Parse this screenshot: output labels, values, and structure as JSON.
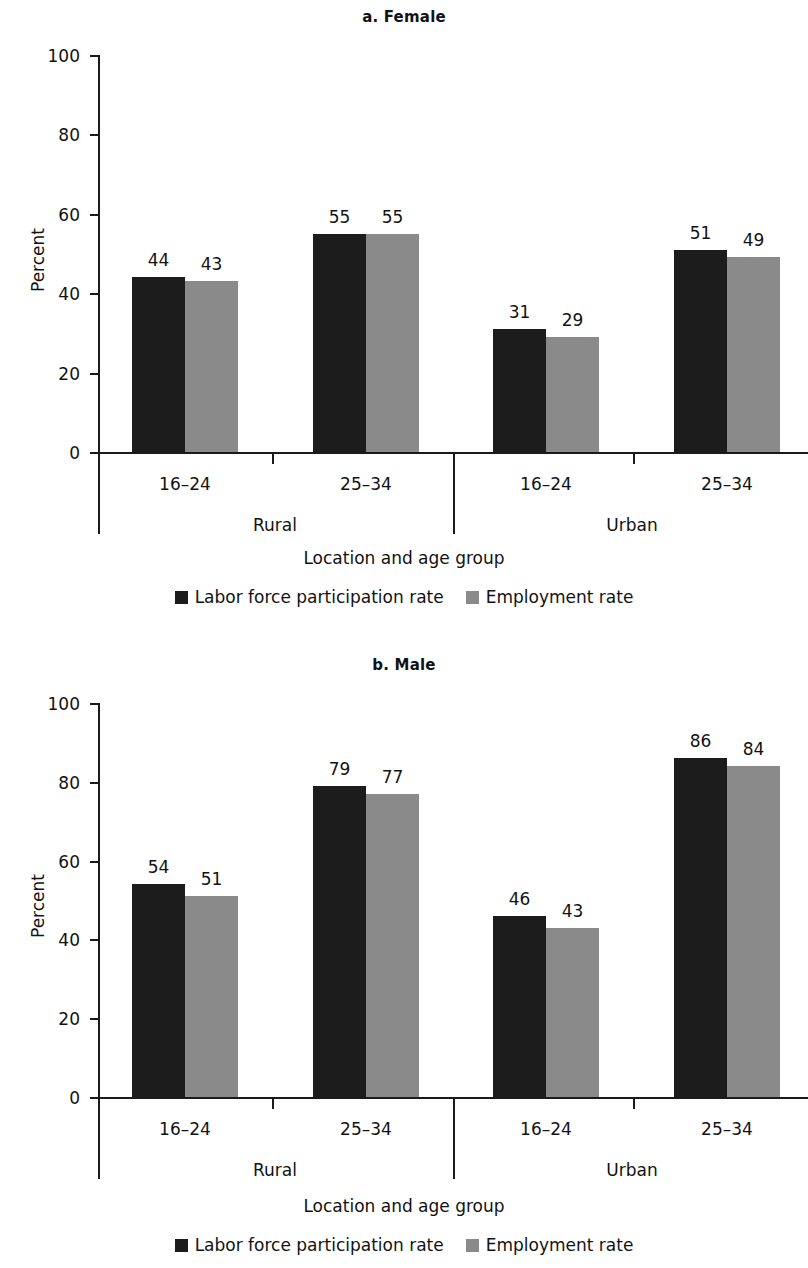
{
  "figure": {
    "panels": [
      {
        "title": "a. Female",
        "ylabel": "Percent",
        "xlabel": "Location and age group",
        "ytick_labels": [
          "100",
          "80",
          "60",
          "40",
          "20",
          "0"
        ],
        "age_labels": [
          "16–24",
          "25–34",
          "16–24",
          "25–34"
        ],
        "location_labels": [
          "Rural",
          "Urban"
        ],
        "values": [
          "44",
          "43",
          "55",
          "55",
          "31",
          "29",
          "51",
          "49"
        ],
        "legend": [
          "Labor force participation rate",
          "Employment rate"
        ]
      },
      {
        "title": "b. Male",
        "ylabel": "Percent",
        "xlabel": "Location and age group",
        "ytick_labels": [
          "100",
          "80",
          "60",
          "40",
          "20",
          "0"
        ],
        "age_labels": [
          "16–24",
          "25–34",
          "16–24",
          "25–34"
        ],
        "location_labels": [
          "Rural",
          "Urban"
        ],
        "values": [
          "54",
          "51",
          "79",
          "77",
          "46",
          "43",
          "86",
          "84"
        ],
        "legend": [
          "Labor force participation rate",
          "Employment rate"
        ]
      }
    ],
    "colors": {
      "series_1": "#1c1c1c",
      "series_2": "#8a8a8a",
      "axis": "#1a1a1a",
      "background": "#ffffff"
    }
  },
  "chart_data": [
    {
      "type": "bar",
      "title": "a. Female",
      "xlabel": "Location and age group",
      "ylabel": "Percent",
      "ylim": [
        0,
        100
      ],
      "yticks": [
        0,
        20,
        40,
        60,
        80,
        100
      ],
      "grid": false,
      "legend_position": "bottom",
      "categories": [
        "Rural 16–24",
        "Rural 25–34",
        "Urban 16–24",
        "Urban 25–34"
      ],
      "group_labels": [
        "Rural",
        "Urban"
      ],
      "age_groups": [
        "16–24",
        "25–34",
        "16–24",
        "25–34"
      ],
      "series": [
        {
          "name": "Labor force participation rate",
          "color": "#1c1c1c",
          "values": [
            44,
            55,
            31,
            51
          ]
        },
        {
          "name": "Employment rate",
          "color": "#8a8a8a",
          "values": [
            43,
            55,
            29,
            49
          ]
        }
      ]
    },
    {
      "type": "bar",
      "title": "b. Male",
      "xlabel": "Location and age group",
      "ylabel": "Percent",
      "ylim": [
        0,
        100
      ],
      "yticks": [
        0,
        20,
        40,
        60,
        80,
        100
      ],
      "grid": false,
      "legend_position": "bottom",
      "categories": [
        "Rural 16–24",
        "Rural 25–34",
        "Urban 16–24",
        "Urban 25–34"
      ],
      "group_labels": [
        "Rural",
        "Urban"
      ],
      "age_groups": [
        "16–24",
        "25–34",
        "16–24",
        "25–34"
      ],
      "series": [
        {
          "name": "Labor force participation rate",
          "color": "#1c1c1c",
          "values": [
            54,
            79,
            46,
            86
          ]
        },
        {
          "name": "Employment rate",
          "color": "#8a8a8a",
          "values": [
            51,
            77,
            43,
            84
          ]
        }
      ]
    }
  ]
}
